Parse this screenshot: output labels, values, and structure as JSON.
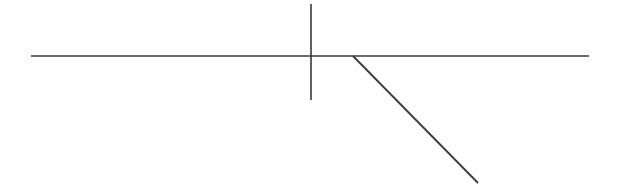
{
  "canvas": {
    "width": 623,
    "height": 187,
    "background_color": "#ffffff",
    "title": "Line drawing"
  },
  "style": {
    "stroke_color": "#3a3a3a",
    "stroke_color_light": "#555555",
    "stroke_width_horizontal": 1.6,
    "stroke_width_vertical": 1.6,
    "stroke_width_diagonal": 1.8
  },
  "chart_data": {
    "type": "line",
    "title": "",
    "xlabel": "",
    "ylabel": "",
    "grid": false,
    "legend": null,
    "xlim": [
      0,
      623
    ],
    "ylim": [
      187,
      0
    ],
    "series": [
      {
        "name": "horizontal-line",
        "x": [
          31,
          589
        ],
        "y": [
          56,
          56
        ]
      },
      {
        "name": "vertical-line",
        "x": [
          311,
          311
        ],
        "y": [
          4,
          100
        ]
      },
      {
        "name": "diagonal-line",
        "x": [
          353,
          478
        ],
        "y": [
          56,
          183
        ]
      }
    ]
  },
  "figure": {
    "strokes": [
      {
        "name": "horizontal-line",
        "x1": 31,
        "y1": 56,
        "x2": 589,
        "y2": 56
      },
      {
        "name": "vertical-line",
        "x1": 311,
        "y1": 4,
        "x2": 311,
        "y2": 100
      },
      {
        "name": "diagonal-line",
        "x1": 353,
        "y1": 56,
        "x2": 478,
        "y2": 183
      }
    ]
  }
}
